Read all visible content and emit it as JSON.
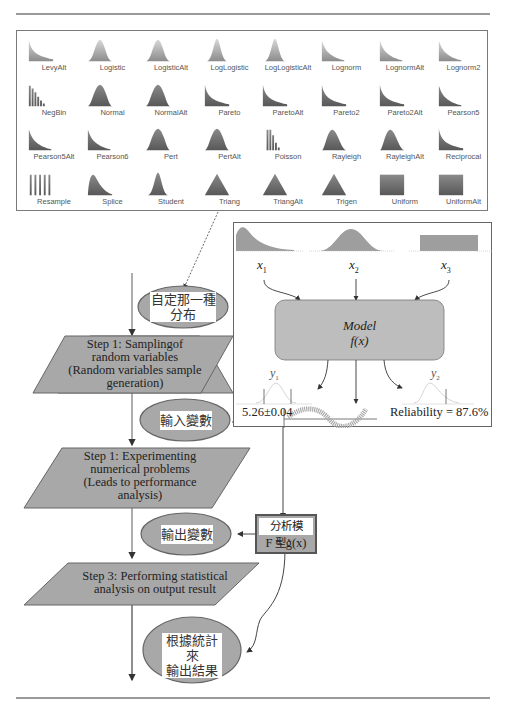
{
  "gallery": {
    "distributions": [
      {
        "label": "LevyAlt",
        "shape": "decay"
      },
      {
        "label": "Logistic",
        "shape": "bell"
      },
      {
        "label": "LogisticAlt",
        "shape": "bell"
      },
      {
        "label": "LogLogistic",
        "shape": "narrow-peak"
      },
      {
        "label": "LogLogisticAlt",
        "shape": "narrow-peak"
      },
      {
        "label": "Lognorm",
        "shape": "skew"
      },
      {
        "label": "LognormAlt",
        "shape": "skew"
      },
      {
        "label": "Lognorm2",
        "shape": "skew"
      },
      {
        "label": "NegBin",
        "shape": "bars-decay"
      },
      {
        "label": "Normal",
        "shape": "bell-dark"
      },
      {
        "label": "NormalAlt",
        "shape": "bell-dark"
      },
      {
        "label": "Pareto",
        "shape": "decay"
      },
      {
        "label": "ParetoAlt",
        "shape": "decay"
      },
      {
        "label": "Pareto2",
        "shape": "decay"
      },
      {
        "label": "Pareto2Alt",
        "shape": "decay"
      },
      {
        "label": "Pearson5",
        "shape": "skew"
      },
      {
        "label": "Pearson5Alt",
        "shape": "skew"
      },
      {
        "label": "Pearson6",
        "shape": "skew"
      },
      {
        "label": "Pert",
        "shape": "bell-dark"
      },
      {
        "label": "PertAlt",
        "shape": "bell-dark"
      },
      {
        "label": "Poisson",
        "shape": "bars-hump"
      },
      {
        "label": "Rayleigh",
        "shape": "bell-skew"
      },
      {
        "label": "RayleighAlt",
        "shape": "bell-skew"
      },
      {
        "label": "Reciprocal",
        "shape": "decay"
      },
      {
        "label": "Resample",
        "shape": "bars-uniform"
      },
      {
        "label": "Splice",
        "shape": "skew-wide"
      },
      {
        "label": "Student",
        "shape": "narrow-peak"
      },
      {
        "label": "Triang",
        "shape": "triangle"
      },
      {
        "label": "TriangAlt",
        "shape": "triangle"
      },
      {
        "label": "Trigen",
        "shape": "triangle"
      },
      {
        "label": "Uniform",
        "shape": "rect"
      },
      {
        "label": "UniformAlt",
        "shape": "rect"
      }
    ]
  },
  "model_panel": {
    "inputs": [
      "x1",
      "x2",
      "x3"
    ],
    "model_title": "Model",
    "model_func": "f(x)",
    "outputs": {
      "y1": "y1",
      "y2": "y2"
    },
    "y1_result": "5.26±0.04",
    "y2_result": "Reliability = 87.6%"
  },
  "flowchart": {
    "ellipse_choose_dist": {
      "line1": "自定那一種",
      "line2": "分布"
    },
    "step1_sampling": [
      "Step 1: Samplingof",
      "random variables",
      "(Random variables sample",
      "generation)"
    ],
    "ellipse_input_var": "輸入變數",
    "step2_experiment": [
      "Step 1: Experimenting",
      "numerical problems",
      "(Leads to performance",
      "analysis)"
    ],
    "analysis_model": {
      "line1": "分析模型：",
      "line2": "F = g(x)"
    },
    "ellipse_output_var": "輸出變數",
    "step3_stats": [
      "Step 3: Performing statistical",
      "analysis on output result"
    ],
    "ellipse_result": {
      "line1": "根據統計來",
      "line2": "輸出結果"
    }
  },
  "colors": {
    "shape_fill": "#a8a8a8",
    "border": "#555555",
    "rule": "#9a9a9a"
  }
}
